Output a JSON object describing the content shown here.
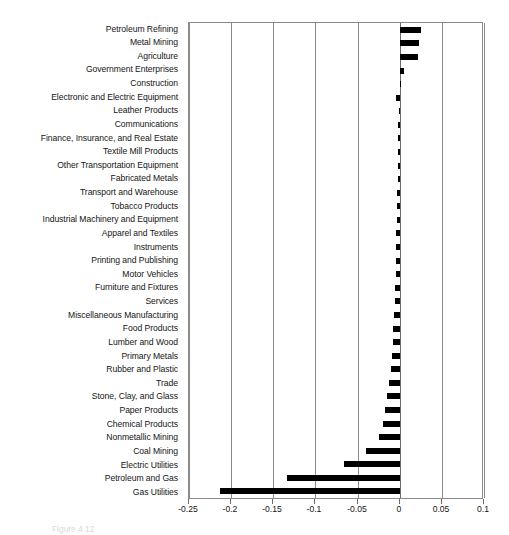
{
  "chart_data": {
    "type": "bar",
    "orientation": "horizontal",
    "title": "",
    "subtitle": "",
    "xlabel": "",
    "ylabel": "",
    "xlim": [
      -0.25,
      0.1
    ],
    "ylim": [
      0,
      32
    ],
    "grid": true,
    "legend": null,
    "bar_color": "#000000",
    "axis_color": "#8a8a8a",
    "xticks": [
      -0.25,
      -0.2,
      -0.15,
      -0.1,
      -0.05,
      0,
      0.05,
      0.1
    ],
    "xticklabels": [
      "-0.25",
      "-0.2",
      "-0.15",
      "-0.1",
      "-0.05",
      "0",
      "0.05",
      "0.1"
    ],
    "categories": [
      "Petroleum Refining",
      "Metal Mining",
      "Agriculture",
      "Government Enterprises",
      "Construction",
      "Electronic and Electric Equipment",
      "Leather Products",
      "Communications",
      "Finance, Insurance, and Real Estate",
      "Textile Mill Products",
      "Other Transportation Equipment",
      "Fabricated Metals",
      "Transport and Warehouse",
      "Tobacco Products",
      "Industrial Machinery and Equipment",
      "Apparel and Textiles",
      "Instruments",
      "Printing and Publishing",
      "Motor Vehicles",
      "Furniture and Fixtures",
      "Services",
      "Miscellaneous Manufacturing",
      "Food Products",
      "Lumber and Wood",
      "Primary Metals",
      "Rubber and Plastic",
      "Trade",
      "Stone, Clay, and Glass",
      "Paper Products",
      "Chemical Products",
      "Nonmetallic Mining",
      "Coal Mining",
      "Electric Utilities",
      "Petroleum and Gas",
      "Gas Utilities"
    ],
    "values": [
      0.0255,
      0.0225,
      0.0215,
      0.005,
      0.0005,
      -0.004,
      -0.001,
      -0.0015,
      -0.0015,
      -0.002,
      -0.002,
      -0.0025,
      -0.003,
      -0.003,
      -0.0035,
      -0.004,
      -0.004,
      -0.0045,
      -0.005,
      -0.0055,
      -0.006,
      -0.0065,
      -0.0075,
      -0.0085,
      -0.0095,
      -0.0105,
      -0.0125,
      -0.015,
      -0.0175,
      -0.02,
      -0.0245,
      -0.0395,
      -0.066,
      -0.1335,
      -0.213
    ]
  },
  "caption": {
    "text": "Figure 4.12"
  }
}
